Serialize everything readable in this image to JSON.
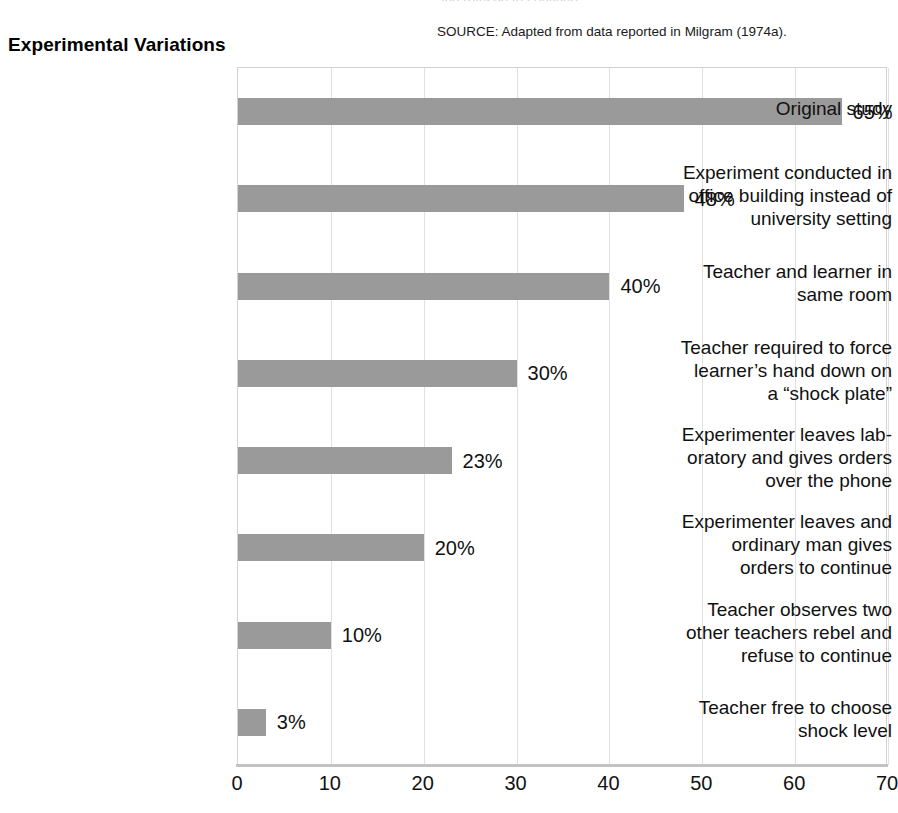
{
  "header": {
    "title": "Experimental Variations",
    "source_note": "SOURCE: Adapted from data reported in Milgram (1974a).",
    "clipped_caption_above": "and refused to continue."
  },
  "chart_data": {
    "type": "bar",
    "orientation": "horizontal",
    "title": "Experimental Variations",
    "xlabel": "",
    "ylabel": "",
    "xlim": [
      0,
      70
    ],
    "xticks": [
      "0",
      "10",
      "20",
      "30",
      "40",
      "50",
      "60",
      "70"
    ],
    "xtick_values": [
      0,
      10,
      20,
      30,
      40,
      50,
      60,
      70
    ],
    "grid": "vertical",
    "legend": "none",
    "bar_color": "#9a9a9a",
    "categories": [
      "Original study",
      "Experiment conducted in office building instead of university setting",
      "Teacher and learner in same room",
      "Teacher required to force learner’s hand down on a “shock plate”",
      "Experimenter leaves lab-oratory and gives orders over the phone",
      "Experimenter leaves and ordinary man gives orders to continue",
      "Teacher observes two other teachers rebel and refuse to continue",
      "Teacher free to choose shock level"
    ],
    "category_lines": [
      [
        "Original study"
      ],
      [
        "Experiment conducted in",
        "office building instead of",
        "university setting"
      ],
      [
        "Teacher and learner in",
        "same room"
      ],
      [
        "Teacher required to force",
        "learner’s hand down on",
        "a “shock plate”"
      ],
      [
        "Experimenter leaves lab-",
        "oratory and gives orders",
        "over the phone"
      ],
      [
        "Experimenter leaves and",
        "ordinary man gives",
        "orders to continue"
      ],
      [
        "Teacher observes two",
        "other teachers rebel and",
        "refuse to continue"
      ],
      [
        "Teacher free to choose",
        "shock level"
      ]
    ],
    "values": [
      65,
      48,
      40,
      30,
      23,
      20,
      10,
      3
    ],
    "value_labels": [
      "65%",
      "48%",
      "40%",
      "30%",
      "23%",
      "20%",
      "10%",
      "3%"
    ]
  }
}
